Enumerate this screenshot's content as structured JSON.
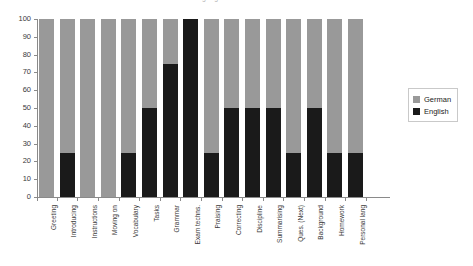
{
  "chart_data": {
    "type": "bar",
    "subtype": "stacked-100-percent",
    "title": "Teacher language use",
    "xlabel": "",
    "ylabel": "",
    "ylim": [
      0,
      100
    ],
    "ytick_step": 10,
    "yticks": [
      0,
      10,
      20,
      30,
      40,
      50,
      60,
      70,
      80,
      90,
      100
    ],
    "ytick_labels": [
      "0",
      "10",
      "20",
      "30",
      "40",
      "50",
      "60",
      "70",
      "80",
      "90",
      "100"
    ],
    "grid": false,
    "legend_position": "right",
    "categories": [
      "Greeting",
      "Introducing",
      "Instructions",
      "Moving on",
      "Vocabulary",
      "Tasks",
      "Grammar",
      "Exam techns.",
      "Praising",
      "Correcting",
      "Discipline",
      "Summarising",
      "Ques. (Next)",
      "Background",
      "Homework",
      "Personal lang"
    ],
    "series": [
      {
        "name": "German",
        "color": "#999999",
        "values": [
          100,
          75,
          100,
          100,
          75,
          50,
          25,
          0,
          75,
          50,
          50,
          50,
          75,
          50,
          75,
          75
        ]
      },
      {
        "name": "English",
        "color": "#1a1a1a",
        "values": [
          0,
          25,
          0,
          0,
          25,
          50,
          75,
          100,
          25,
          50,
          50,
          50,
          25,
          50,
          25,
          25
        ]
      }
    ]
  },
  "legend": {
    "items": [
      {
        "label": "German",
        "swatch": "german"
      },
      {
        "label": "English",
        "swatch": "english"
      }
    ]
  }
}
